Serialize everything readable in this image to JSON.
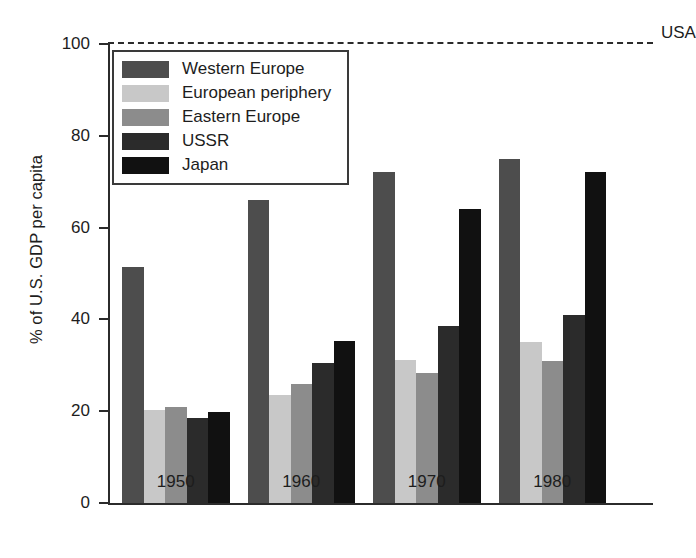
{
  "chart_data": {
    "type": "bar",
    "title": "",
    "xlabel": "",
    "ylabel": "% of U.S. GDP per capita",
    "categories": [
      "1950",
      "1960",
      "1970",
      "1980"
    ],
    "ylim": [
      0,
      100
    ],
    "yticks": [
      0,
      20,
      40,
      60,
      80,
      100
    ],
    "ytick_labels": [
      "0",
      "20",
      "40",
      "60",
      "80",
      "100"
    ],
    "grid": false,
    "legend_position": "upper-left-inside",
    "series": [
      {
        "name": "Western Europe",
        "color": "#4d4d4d",
        "values": [
          51.5,
          66.0,
          72.0,
          75.0
        ]
      },
      {
        "name": "European periphery",
        "color": "#c8c8c8",
        "values": [
          20.3,
          23.5,
          31.2,
          35.0
        ]
      },
      {
        "name": "Eastern Europe",
        "color": "#8c8c8c",
        "values": [
          20.8,
          26.0,
          28.2,
          31.0
        ]
      },
      {
        "name": "USSR",
        "color": "#2b2b2b",
        "values": [
          18.5,
          30.5,
          38.5,
          41.0
        ]
      },
      {
        "name": "Japan",
        "color": "#111111",
        "values": [
          19.8,
          35.2,
          64.0,
          72.0
        ]
      }
    ],
    "reference_line": {
      "label": "USA",
      "value": 100,
      "style": "dashed",
      "color": "#2b2b2b"
    }
  },
  "legend": {
    "entries": [
      "Western Europe",
      "European periphery",
      "Eastern Europe",
      "USSR",
      "Japan"
    ]
  }
}
